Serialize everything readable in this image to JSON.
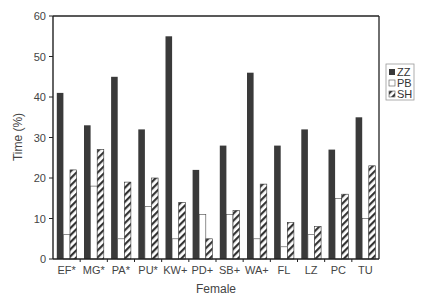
{
  "chart_data": {
    "type": "bar",
    "title": "",
    "xlabel": "Female",
    "ylabel": "Time (%)",
    "ylim": [
      0,
      60
    ],
    "yticks": [
      0,
      10,
      20,
      30,
      40,
      50,
      60
    ],
    "grid": false,
    "legend_position": "right",
    "categories": [
      "EF*",
      "MG*",
      "PA*",
      "PU*",
      "KW+",
      "PD+",
      "SB+",
      "WA+",
      "FL",
      "LZ",
      "PC",
      "TU"
    ],
    "series": [
      {
        "name": "ZZ",
        "style": "solid-dark",
        "color": "#3a3a3a",
        "values": [
          41,
          33,
          45,
          32,
          55,
          22,
          28,
          46,
          28,
          32,
          27,
          35
        ]
      },
      {
        "name": "PB",
        "style": "white",
        "color": "#ffffff",
        "values": [
          6,
          18,
          5,
          13,
          5,
          11,
          11,
          5,
          3,
          6,
          15,
          10
        ]
      },
      {
        "name": "SH",
        "style": "hatched",
        "color": "#333333",
        "values": [
          22,
          27,
          19,
          20,
          14,
          5,
          12,
          18.5,
          9,
          8,
          16,
          23
        ]
      }
    ]
  }
}
